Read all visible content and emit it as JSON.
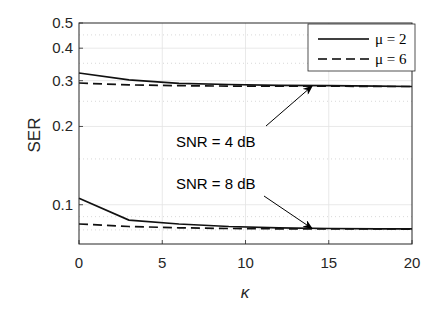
{
  "chart_data": {
    "type": "line",
    "title": "",
    "xlabel": "κ",
    "ylabel": "SER",
    "xlim": [
      0,
      20
    ],
    "ylim": [
      0.07,
      0.5
    ],
    "yscale": "log",
    "grid": true,
    "xticks": [
      0,
      5,
      10,
      15,
      20
    ],
    "xtick_labels": [
      "0",
      "5",
      "10",
      "15",
      "20"
    ],
    "yticks": [
      0.1,
      0.2,
      0.3,
      0.4,
      0.5
    ],
    "ytick_labels": [
      "0.1",
      "0.2",
      "0.3",
      "0.4",
      "0.5"
    ],
    "legend_position": "upper right",
    "legend": [
      "μ = 2",
      "μ = 6"
    ],
    "series": [
      {
        "name": "μ = 2",
        "group": "SNR = 4 dB",
        "style": "solid",
        "x": [
          0,
          3,
          6,
          9,
          12,
          15,
          18,
          20
        ],
        "values": [
          0.321,
          0.302,
          0.293,
          0.29,
          0.288,
          0.287,
          0.286,
          0.285
        ]
      },
      {
        "name": "μ = 6",
        "group": "SNR = 4 dB",
        "style": "dashed",
        "x": [
          0,
          3,
          6,
          9,
          12,
          15,
          18,
          20
        ],
        "values": [
          0.294,
          0.289,
          0.287,
          0.286,
          0.286,
          0.286,
          0.285,
          0.285
        ]
      },
      {
        "name": "μ = 2",
        "group": "SNR = 8 dB",
        "style": "solid",
        "x": [
          0,
          3,
          6,
          9,
          12,
          15,
          18,
          20
        ],
        "values": [
          0.106,
          0.0873,
          0.0843,
          0.0825,
          0.0815,
          0.081,
          0.0808,
          0.0807
        ]
      },
      {
        "name": "μ = 6",
        "group": "SNR = 8 dB",
        "style": "dashed",
        "x": [
          0,
          3,
          6,
          9,
          12,
          15,
          18,
          20
        ],
        "values": [
          0.0843,
          0.0825,
          0.0815,
          0.081,
          0.0808,
          0.0807,
          0.0807,
          0.0806
        ]
      }
    ],
    "annotations": [
      {
        "text": "SNR = 4 dB",
        "arrow_to": [
          14,
          0.286
        ]
      },
      {
        "text": "SNR = 8 dB",
        "arrow_to": [
          14,
          0.081
        ]
      }
    ]
  }
}
